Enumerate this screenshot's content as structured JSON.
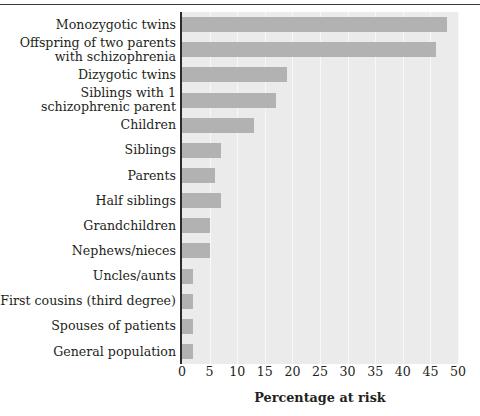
{
  "chart_data": {
    "type": "bar",
    "orientation": "horizontal",
    "title": "",
    "xlabel": "Percentage at risk",
    "ylabel": "",
    "xlim": [
      0,
      50
    ],
    "xticks": [
      "0",
      "5",
      "10",
      "15",
      "20",
      "25",
      "30",
      "35",
      "40",
      "45",
      "50"
    ],
    "grid": "vertical",
    "legend": "none",
    "bar_color": "#b2b2b2",
    "panel_color": "#ebebeb",
    "categories": [
      "Monozygotic twins",
      "Offspring of two parents\nwith schizophrenia",
      "Dizygotic twins",
      "Siblings with 1\nschizophrenic parent",
      "Children",
      "Siblings",
      "Parents",
      "Half siblings",
      "Grandchildren",
      "Nephews/nieces",
      "Uncles/aunts",
      "First cousins (third degree)",
      "Spouses of patients",
      "General population"
    ],
    "values": [
      48,
      46,
      19,
      17,
      13,
      7,
      6,
      7,
      5,
      5,
      2,
      2,
      2,
      2
    ]
  }
}
